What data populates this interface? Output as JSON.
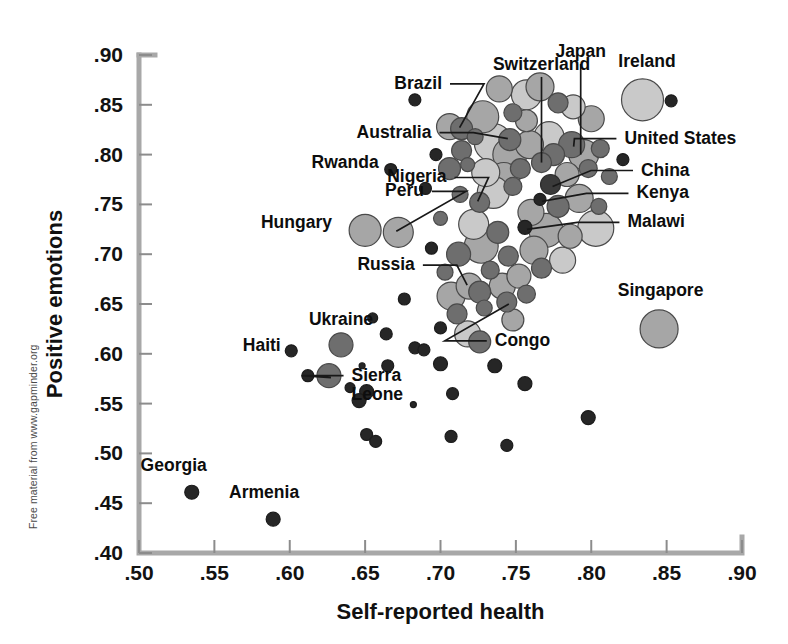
{
  "figure": {
    "credit": "Free material from www.gapminder.org"
  },
  "chart_data": {
    "type": "scatter",
    "title": "",
    "xlabel": "Self-reported health",
    "ylabel": "Positive emotions",
    "xlim": [
      0.5,
      0.9
    ],
    "ylim": [
      0.4,
      0.9
    ],
    "xticks": [
      ".50",
      ".55",
      ".60",
      ".65",
      ".70",
      ".75",
      ".80",
      ".85",
      ".90"
    ],
    "xtickvalues": [
      0.5,
      0.55,
      0.6,
      0.65,
      0.7,
      0.75,
      0.8,
      0.85,
      0.9
    ],
    "yticks": [
      ".40",
      ".45",
      ".50",
      ".55",
      ".60",
      ".65",
      ".70",
      ".75",
      ".80",
      ".85",
      ".90"
    ],
    "ytickvalues": [
      0.4,
      0.45,
      0.5,
      0.55,
      0.6,
      0.65,
      0.7,
      0.75,
      0.8,
      0.85,
      0.9
    ],
    "grid": false,
    "legend": null,
    "size_encoding": "population",
    "labeled_points": [
      {
        "name": "Georgia",
        "x": 0.535,
        "y": 0.461,
        "r": 7,
        "shade": "bk"
      },
      {
        "name": "Armenia",
        "x": 0.589,
        "y": 0.434,
        "r": 7,
        "shade": "bk"
      },
      {
        "name": "Haiti",
        "x": 0.601,
        "y": 0.603,
        "r": 6,
        "shade": "bk"
      },
      {
        "name": "Sierra Leone",
        "x": 0.626,
        "y": 0.578,
        "r": 12,
        "shade": "dk"
      },
      {
        "name": "Ukraine",
        "x": 0.634,
        "y": 0.609,
        "r": 12,
        "shade": "dk"
      },
      {
        "name": "Hungary",
        "x": 0.65,
        "y": 0.724,
        "r": 16,
        "shade": "md"
      },
      {
        "name": "Rwanda",
        "x": 0.667,
        "y": 0.785,
        "r": 6,
        "shade": "bk"
      },
      {
        "name": "Peru",
        "x": 0.672,
        "y": 0.722,
        "r": 15,
        "shade": "md"
      },
      {
        "name": "Russia",
        "x": 0.719,
        "y": 0.668,
        "r": 13,
        "shade": "md"
      },
      {
        "name": "Congo",
        "x": 0.744,
        "y": 0.652,
        "r": 10,
        "shade": "dk"
      },
      {
        "name": "Nigeria",
        "x": 0.726,
        "y": 0.752,
        "r": 10,
        "shade": "dk"
      },
      {
        "name": "Brazil",
        "x": 0.714,
        "y": 0.826,
        "r": 11,
        "shade": "dk"
      },
      {
        "name": "Australia",
        "x": 0.746,
        "y": 0.815,
        "r": 11,
        "shade": "dk"
      },
      {
        "name": "Switzerland",
        "x": 0.767,
        "y": 0.792,
        "r": 10,
        "shade": "dk"
      },
      {
        "name": "Japan",
        "x": 0.775,
        "y": 0.8,
        "r": 11,
        "shade": "dk"
      },
      {
        "name": "Ireland",
        "x": 0.834,
        "y": 0.855,
        "r": 21,
        "shade": "lt"
      },
      {
        "name": "United States",
        "x": 0.787,
        "y": 0.81,
        "r": 13,
        "shade": "dk"
      },
      {
        "name": "China",
        "x": 0.773,
        "y": 0.77,
        "r": 10,
        "shade": "xd"
      },
      {
        "name": "Kenya",
        "x": 0.766,
        "y": 0.755,
        "r": 6,
        "shade": "bk"
      },
      {
        "name": "Malawi",
        "x": 0.756,
        "y": 0.727,
        "r": 7,
        "shade": "bk"
      },
      {
        "name": "Singapore",
        "x": 0.845,
        "y": 0.625,
        "r": 19,
        "shade": "md"
      }
    ],
    "annotations": [
      {
        "label": "Georgia",
        "lx": 0.523,
        "ly": 0.482,
        "anchor": "mid",
        "leader": false
      },
      {
        "label": "Armenia",
        "lx": 0.583,
        "ly": 0.455,
        "anchor": "mid",
        "leader": false
      },
      {
        "label": "Haiti",
        "lx": 0.594,
        "ly": 0.603,
        "anchor": "end",
        "leader": false
      },
      {
        "label": "Sierra Leone",
        "lx": 0.641,
        "ly": 0.573,
        "anchor": "start",
        "leader": true
      },
      {
        "label": "Ukraine",
        "lx": 0.634,
        "ly": 0.629,
        "anchor": "mid",
        "leader": false
      },
      {
        "label": "Hungary",
        "lx": 0.628,
        "ly": 0.726,
        "anchor": "end",
        "leader": false
      },
      {
        "label": "Rwanda",
        "lx": 0.659,
        "ly": 0.787,
        "anchor": "end",
        "leader": false
      },
      {
        "label": "Peru",
        "lx": 0.689,
        "ly": 0.758,
        "anchor": "end",
        "leader": true
      },
      {
        "label": "Russia",
        "lx": 0.683,
        "ly": 0.684,
        "anchor": "end",
        "leader": true
      },
      {
        "label": "Congo",
        "lx": 0.736,
        "ly": 0.608,
        "anchor": "start",
        "leader": true
      },
      {
        "label": "Nigeria",
        "lx": 0.704,
        "ly": 0.772,
        "anchor": "end",
        "leader": true
      },
      {
        "label": "Brazil",
        "lx": 0.701,
        "ly": 0.866,
        "anchor": "end",
        "leader": true
      },
      {
        "label": "Australia",
        "lx": 0.694,
        "ly": 0.817,
        "anchor": "end",
        "leader": true
      },
      {
        "label": "Switzerland",
        "lx": 0.767,
        "ly": 0.885,
        "anchor": "mid",
        "leader": true
      },
      {
        "label": "Japan",
        "lx": 0.793,
        "ly": 0.898,
        "anchor": "mid",
        "leader": true
      },
      {
        "label": "Ireland",
        "lx": 0.837,
        "ly": 0.888,
        "anchor": "mid",
        "leader": false
      },
      {
        "label": "United States",
        "lx": 0.822,
        "ly": 0.811,
        "anchor": "start",
        "leader": true
      },
      {
        "label": "China",
        "lx": 0.833,
        "ly": 0.779,
        "anchor": "start",
        "leader": true
      },
      {
        "label": "Kenya",
        "lx": 0.83,
        "ly": 0.756,
        "anchor": "start",
        "leader": true
      },
      {
        "label": "Malawi",
        "lx": 0.824,
        "ly": 0.727,
        "anchor": "start",
        "leader": true
      },
      {
        "label": "Singapore",
        "lx": 0.846,
        "ly": 0.658,
        "anchor": "mid",
        "leader": false
      }
    ],
    "unlabeled_points": [
      {
        "x": 0.683,
        "y": 0.855,
        "r": 6,
        "shade": "bk"
      },
      {
        "x": 0.739,
        "y": 0.866,
        "r": 13,
        "shade": "md"
      },
      {
        "x": 0.757,
        "y": 0.86,
        "r": 15,
        "shade": "lt"
      },
      {
        "x": 0.766,
        "y": 0.868,
        "r": 14,
        "shade": "md"
      },
      {
        "x": 0.778,
        "y": 0.852,
        "r": 10,
        "shade": "dk"
      },
      {
        "x": 0.788,
        "y": 0.848,
        "r": 12,
        "shade": "lt"
      },
      {
        "x": 0.853,
        "y": 0.854,
        "r": 6,
        "shade": "bk"
      },
      {
        "x": 0.706,
        "y": 0.828,
        "r": 13,
        "shade": "md"
      },
      {
        "x": 0.728,
        "y": 0.838,
        "r": 16,
        "shade": "md"
      },
      {
        "x": 0.748,
        "y": 0.842,
        "r": 9,
        "shade": "dk"
      },
      {
        "x": 0.757,
        "y": 0.834,
        "r": 11,
        "shade": "md"
      },
      {
        "x": 0.8,
        "y": 0.836,
        "r": 13,
        "shade": "md"
      },
      {
        "x": 0.714,
        "y": 0.804,
        "r": 10,
        "shade": "dk"
      },
      {
        "x": 0.723,
        "y": 0.818,
        "r": 8,
        "shade": "dk"
      },
      {
        "x": 0.735,
        "y": 0.812,
        "r": 19,
        "shade": "lt"
      },
      {
        "x": 0.746,
        "y": 0.8,
        "r": 17,
        "shade": "md"
      },
      {
        "x": 0.759,
        "y": 0.81,
        "r": 14,
        "shade": "md"
      },
      {
        "x": 0.772,
        "y": 0.818,
        "r": 15,
        "shade": "lt"
      },
      {
        "x": 0.795,
        "y": 0.8,
        "r": 15,
        "shade": "md"
      },
      {
        "x": 0.806,
        "y": 0.806,
        "r": 9,
        "shade": "dk"
      },
      {
        "x": 0.821,
        "y": 0.795,
        "r": 6,
        "shade": "bk"
      },
      {
        "x": 0.697,
        "y": 0.8,
        "r": 6,
        "shade": "bk"
      },
      {
        "x": 0.706,
        "y": 0.786,
        "r": 11,
        "shade": "dk"
      },
      {
        "x": 0.718,
        "y": 0.79,
        "r": 7,
        "shade": "dk"
      },
      {
        "x": 0.73,
        "y": 0.782,
        "r": 14,
        "shade": "lt"
      },
      {
        "x": 0.742,
        "y": 0.776,
        "r": 16,
        "shade": "md"
      },
      {
        "x": 0.753,
        "y": 0.786,
        "r": 10,
        "shade": "dk"
      },
      {
        "x": 0.784,
        "y": 0.78,
        "r": 12,
        "shade": "md"
      },
      {
        "x": 0.798,
        "y": 0.786,
        "r": 9,
        "shade": "dk"
      },
      {
        "x": 0.812,
        "y": 0.778,
        "r": 8,
        "shade": "dk"
      },
      {
        "x": 0.69,
        "y": 0.766,
        "r": 6,
        "shade": "bk"
      },
      {
        "x": 0.713,
        "y": 0.76,
        "r": 8,
        "shade": "dk"
      },
      {
        "x": 0.735,
        "y": 0.762,
        "r": 16,
        "shade": "lt"
      },
      {
        "x": 0.748,
        "y": 0.768,
        "r": 9,
        "shade": "dk"
      },
      {
        "x": 0.76,
        "y": 0.742,
        "r": 13,
        "shade": "md"
      },
      {
        "x": 0.778,
        "y": 0.748,
        "r": 11,
        "shade": "dk"
      },
      {
        "x": 0.792,
        "y": 0.756,
        "r": 14,
        "shade": "md"
      },
      {
        "x": 0.805,
        "y": 0.748,
        "r": 8,
        "shade": "dk"
      },
      {
        "x": 0.7,
        "y": 0.736,
        "r": 7,
        "shade": "dk"
      },
      {
        "x": 0.722,
        "y": 0.73,
        "r": 15,
        "shade": "lt"
      },
      {
        "x": 0.738,
        "y": 0.722,
        "r": 11,
        "shade": "dk"
      },
      {
        "x": 0.77,
        "y": 0.724,
        "r": 17,
        "shade": "md"
      },
      {
        "x": 0.786,
        "y": 0.718,
        "r": 12,
        "shade": "md"
      },
      {
        "x": 0.803,
        "y": 0.726,
        "r": 18,
        "shade": "lt"
      },
      {
        "x": 0.694,
        "y": 0.706,
        "r": 6,
        "shade": "bk"
      },
      {
        "x": 0.712,
        "y": 0.7,
        "r": 12,
        "shade": "dk"
      },
      {
        "x": 0.727,
        "y": 0.708,
        "r": 17,
        "shade": "md"
      },
      {
        "x": 0.745,
        "y": 0.698,
        "r": 10,
        "shade": "dk"
      },
      {
        "x": 0.762,
        "y": 0.704,
        "r": 14,
        "shade": "md"
      },
      {
        "x": 0.781,
        "y": 0.694,
        "r": 13,
        "shade": "lt"
      },
      {
        "x": 0.703,
        "y": 0.682,
        "r": 8,
        "shade": "dk"
      },
      {
        "x": 0.733,
        "y": 0.684,
        "r": 9,
        "shade": "dk"
      },
      {
        "x": 0.752,
        "y": 0.678,
        "r": 12,
        "shade": "md"
      },
      {
        "x": 0.767,
        "y": 0.686,
        "r": 10,
        "shade": "dk"
      },
      {
        "x": 0.707,
        "y": 0.658,
        "r": 14,
        "shade": "md"
      },
      {
        "x": 0.726,
        "y": 0.662,
        "r": 11,
        "shade": "dk"
      },
      {
        "x": 0.741,
        "y": 0.668,
        "r": 13,
        "shade": "md"
      },
      {
        "x": 0.757,
        "y": 0.66,
        "r": 9,
        "shade": "dk"
      },
      {
        "x": 0.676,
        "y": 0.655,
        "r": 6,
        "shade": "bk"
      },
      {
        "x": 0.711,
        "y": 0.64,
        "r": 10,
        "shade": "dk"
      },
      {
        "x": 0.729,
        "y": 0.646,
        "r": 8,
        "shade": "dk"
      },
      {
        "x": 0.748,
        "y": 0.634,
        "r": 11,
        "shade": "md"
      },
      {
        "x": 0.7,
        "y": 0.626,
        "r": 6,
        "shade": "bk"
      },
      {
        "x": 0.718,
        "y": 0.62,
        "r": 13,
        "shade": "lt"
      },
      {
        "x": 0.726,
        "y": 0.612,
        "r": 11,
        "shade": "dk"
      },
      {
        "x": 0.683,
        "y": 0.606,
        "r": 6,
        "shade": "bk"
      },
      {
        "x": 0.689,
        "y": 0.604,
        "r": 6,
        "shade": "bk"
      },
      {
        "x": 0.664,
        "y": 0.62,
        "r": 6,
        "shade": "bk"
      },
      {
        "x": 0.655,
        "y": 0.636,
        "r": 5,
        "shade": "bk"
      },
      {
        "x": 0.612,
        "y": 0.578,
        "r": 6,
        "shade": "bk"
      },
      {
        "x": 0.648,
        "y": 0.588,
        "r": 3,
        "shade": "bk"
      },
      {
        "x": 0.7,
        "y": 0.59,
        "r": 7,
        "shade": "bk"
      },
      {
        "x": 0.665,
        "y": 0.588,
        "r": 6,
        "shade": "bk"
      },
      {
        "x": 0.736,
        "y": 0.588,
        "r": 7,
        "shade": "bk"
      },
      {
        "x": 0.756,
        "y": 0.57,
        "r": 7,
        "shade": "bk"
      },
      {
        "x": 0.708,
        "y": 0.56,
        "r": 6,
        "shade": "bk"
      },
      {
        "x": 0.651,
        "y": 0.562,
        "r": 7,
        "shade": "bk"
      },
      {
        "x": 0.646,
        "y": 0.553,
        "r": 7,
        "shade": "bk"
      },
      {
        "x": 0.64,
        "y": 0.566,
        "r": 5,
        "shade": "bk"
      },
      {
        "x": 0.682,
        "y": 0.549,
        "r": 3,
        "shade": "bk"
      },
      {
        "x": 0.798,
        "y": 0.536,
        "r": 7,
        "shade": "bk"
      },
      {
        "x": 0.744,
        "y": 0.508,
        "r": 6,
        "shade": "bk"
      },
      {
        "x": 0.651,
        "y": 0.519,
        "r": 6,
        "shade": "bk"
      },
      {
        "x": 0.657,
        "y": 0.512,
        "r": 6,
        "shade": "bk"
      },
      {
        "x": 0.707,
        "y": 0.517,
        "r": 6,
        "shade": "bk"
      }
    ]
  }
}
